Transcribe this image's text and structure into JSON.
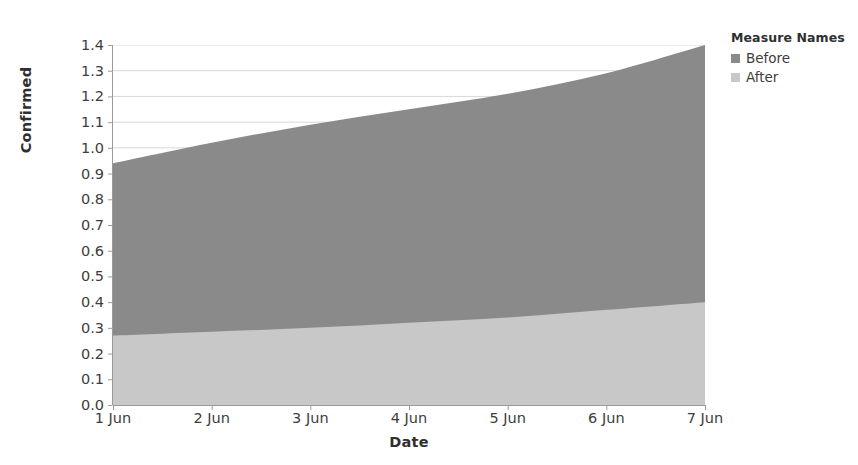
{
  "chart_data": {
    "type": "area",
    "stacked": true,
    "title": "",
    "xlabel": "Date",
    "ylabel": "Confirmed",
    "categories": [
      "1 Jun",
      "2 Jun",
      "3 Jun",
      "4 Jun",
      "5 Jun",
      "6 Jun",
      "7 Jun"
    ],
    "x_tick_labels": [
      "1 Jun",
      "2 Jun",
      "3 Jun",
      "4 Jun",
      "5 Jun",
      "6 Jun",
      "7 Jun"
    ],
    "y_tick_labels": [
      "1.4",
      "1.3",
      "1.2",
      "1.1",
      "1.0",
      "0.9",
      "0.8",
      "0.7",
      "0.6",
      "0.5",
      "0.4",
      "0.3",
      "0.2",
      "0.1",
      "0.0"
    ],
    "ylim": [
      0.0,
      1.4
    ],
    "xlim": [
      "1 Jun",
      "7 Jun"
    ],
    "y_tick_step": 0.1,
    "grid": true,
    "grid_axis": "y",
    "legend_position": "right",
    "series": [
      {
        "name": "Before",
        "color": "#8a8a8a",
        "values": [
          0.67,
          0.735,
          0.78,
          0.8,
          0.82,
          0.86,
          1.0
        ],
        "stack_top": [
          0.94,
          1.02,
          1.09,
          1.15,
          1.21,
          1.29,
          1.4
        ]
      },
      {
        "name": "After",
        "color": "#c8c8c8",
        "values": [
          0.27,
          0.285,
          0.3,
          0.32,
          0.34,
          0.37,
          0.4
        ],
        "stack_top": [
          0.27,
          0.285,
          0.3,
          0.32,
          0.34,
          0.37,
          0.4
        ]
      }
    ]
  },
  "legend": {
    "title": "Measure Names",
    "items": [
      {
        "label": "Before",
        "color": "#8a8a8a"
      },
      {
        "label": "After",
        "color": "#c8c8c8"
      }
    ]
  },
  "axes": {
    "y_title": "Confirmed",
    "x_title": "Date"
  },
  "colors": {
    "before": "#8a8a8a",
    "after": "#c8c8c8",
    "gridline": "#d8d8d8",
    "axis": "#9a9a9a",
    "text": "#3d3d3d"
  }
}
